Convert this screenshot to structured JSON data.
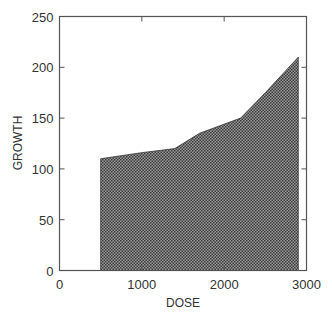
{
  "chart_data": {
    "type": "area",
    "title": "",
    "xlabel": "DOSE",
    "ylabel": "GROWTH",
    "xlim": [
      0,
      3000
    ],
    "ylim": [
      0,
      250
    ],
    "x_ticks": [
      0,
      1000,
      2000,
      3000
    ],
    "y_ticks": [
      0,
      50,
      100,
      150,
      200,
      250
    ],
    "x_tick_labels": [
      "0",
      "1000",
      "2000",
      "3000"
    ],
    "y_tick_labels": [
      "0",
      "50",
      "100",
      "150",
      "200",
      "250"
    ],
    "grid": false,
    "legend": null,
    "fill_pattern": "crosshatch",
    "series": [
      {
        "name": "GROWTH",
        "x": [
          500,
          1000,
          1400,
          1700,
          2200,
          2500,
          2900
        ],
        "values": [
          110,
          116,
          120,
          135,
          150,
          175,
          210
        ]
      }
    ]
  }
}
